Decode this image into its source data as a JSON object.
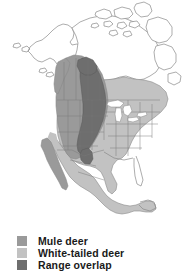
{
  "figure": {
    "kind": "range-map",
    "background_color": "#ffffff"
  },
  "map": {
    "title": "",
    "region": "North America",
    "water_color": "#ffffff",
    "coast_line_color": "#8a8a8a",
    "border_line_color": "#7a7a7a",
    "unshaded_land_color": "#ffffff",
    "areas": [
      {
        "name": "alaska",
        "fill": "unshaded"
      },
      {
        "name": "canada-arctic-islands",
        "fill": "unshaded"
      },
      {
        "name": "canada-north",
        "fill": "unshaded"
      },
      {
        "name": "western-north-america",
        "fill": "mule"
      },
      {
        "name": "eastern-north-america",
        "fill": "whitetail"
      },
      {
        "name": "rocky-mountain-great-plains-corridor",
        "fill": "overlap"
      },
      {
        "name": "mexico",
        "fill": "whitetail"
      },
      {
        "name": "baja-california",
        "fill": "mule"
      },
      {
        "name": "central-america",
        "fill": "whitetail"
      },
      {
        "name": "great-lakes",
        "fill": "water"
      }
    ]
  },
  "colors": {
    "mule": "#9a9a9a",
    "whitetail": "#c2c2c2",
    "overlap": "#6e6e6e",
    "water": "#ffffff",
    "outline": "#8a8a8a",
    "text": "#1a1a1a"
  },
  "legend": {
    "position": "bottom-left",
    "items": [
      {
        "label": "Mule deer",
        "swatch": "#9a9a9a",
        "key": "mule"
      },
      {
        "label": "White-tailed deer",
        "swatch": "#c2c2c2",
        "key": "whitetail"
      },
      {
        "label": "Range overlap",
        "swatch": "#6e6e6e",
        "key": "overlap"
      }
    ]
  }
}
